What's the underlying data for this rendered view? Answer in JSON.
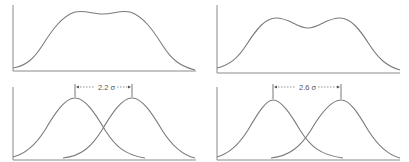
{
  "figure": {
    "panels": [
      {
        "id": "left-top",
        "label": "Sum of two Gaussians, separation 2.2σ (flat-topped)"
      },
      {
        "id": "right-top",
        "label": "Sum of two Gaussians, separation 2.6σ (bimodal)"
      },
      {
        "id": "left-bottom",
        "separation_label": "2.2 σ",
        "separation_sigma": 2.2
      },
      {
        "id": "right-bottom",
        "separation_label": "2.6 σ",
        "separation_sigma": 2.6
      }
    ]
  },
  "labels": {
    "left_separation": "2.2 σ",
    "right_separation": "2.6 σ"
  },
  "colors": {
    "curve": "#7a7a7a",
    "axis": "#8a8a8a",
    "background": "#ffffff"
  }
}
